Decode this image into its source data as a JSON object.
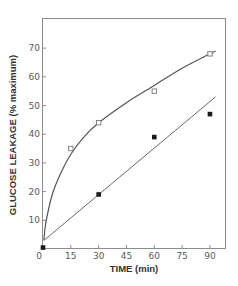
{
  "chart_data": {
    "type": "scatter",
    "title": "",
    "xlabel": "TIME (min)",
    "ylabel": "GLUCOSE LEAKAGE (% maximum)",
    "xlim": [
      0,
      97
    ],
    "ylim": [
      0,
      80
    ],
    "x_ticks": [
      0,
      15,
      30,
      45,
      60,
      75,
      90
    ],
    "x_tick_labels": [
      "0",
      "15",
      "30",
      "45",
      "60",
      "75",
      "90"
    ],
    "y_ticks": [
      10,
      20,
      30,
      40,
      50,
      60,
      70
    ],
    "y_tick_labels": [
      "10",
      "20",
      "30",
      "40",
      "50",
      "60",
      "70"
    ],
    "grid": false,
    "legend": null,
    "series": [
      {
        "name": "open squares",
        "marker": "open-square",
        "x": [
          15,
          30,
          60,
          90
        ],
        "y": [
          35,
          44,
          55,
          68
        ],
        "fit": "curve",
        "fit_points": [
          [
            0.5,
            3
          ],
          [
            1.5,
            9
          ],
          [
            5,
            19
          ],
          [
            10,
            27
          ],
          [
            15,
            33
          ],
          [
            22,
            39
          ],
          [
            30,
            44
          ],
          [
            45,
            51
          ],
          [
            60,
            57
          ],
          [
            75,
            63
          ],
          [
            90,
            68
          ],
          [
            93,
            69
          ]
        ]
      },
      {
        "name": "filled squares",
        "marker": "filled-square",
        "x": [
          0,
          30,
          60,
          90
        ],
        "y": [
          0.5,
          19,
          39,
          47
        ],
        "fit": "linear",
        "fit_points": [
          [
            0.5,
            3
          ],
          [
            93,
            53
          ]
        ]
      }
    ]
  },
  "axes": {
    "x_title": "TIME (min)",
    "y_title": "GLUCOSE LEAKAGE (% maximum)",
    "x_zero_label": "0"
  }
}
